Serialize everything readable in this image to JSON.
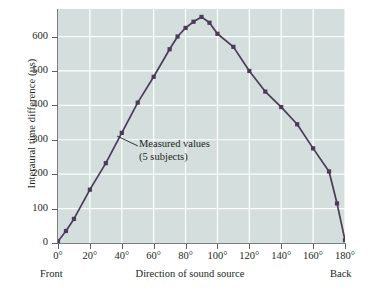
{
  "chart_data": {
    "type": "line",
    "title": "",
    "xlabel": "Direction of sound source",
    "ylabel": "Interaural time difference (µs)",
    "xlim": [
      0,
      180
    ],
    "ylim": [
      0,
      680
    ],
    "grid": true,
    "legend_position": "none",
    "xticks": [
      "0°",
      "20°",
      "40°",
      "60°",
      "80°",
      "100°",
      "120°",
      "140°",
      "160°",
      "180°"
    ],
    "xtick_values": [
      0,
      20,
      40,
      60,
      80,
      100,
      120,
      140,
      160,
      180
    ],
    "yticks": [
      "0",
      "100",
      "200",
      "300",
      "400",
      "500",
      "600"
    ],
    "ytick_values": [
      0,
      100,
      200,
      300,
      400,
      500,
      600
    ],
    "x_end_labels": {
      "left": "Front",
      "right": "Back"
    },
    "series": [
      {
        "name": "Measured values (5 subjects)",
        "color": "#4b3a5a",
        "marker": "square",
        "x": [
          0,
          5,
          10,
          20,
          30,
          40,
          50,
          60,
          70,
          75,
          80,
          85,
          90,
          95,
          100,
          110,
          120,
          130,
          140,
          150,
          160,
          170,
          175,
          180
        ],
        "y": [
          5,
          35,
          70,
          155,
          232,
          320,
          408,
          483,
          563,
          600,
          625,
          643,
          657,
          640,
          608,
          570,
          500,
          440,
          395,
          345,
          275,
          208,
          115,
          8
        ]
      }
    ],
    "annotations": [
      {
        "text_lines": [
          "Measured values",
          "(5 subjects)"
        ],
        "leader_from": [
          138,
          146
        ],
        "leader_to": [
          117,
          136
        ]
      }
    ]
  },
  "axis": {
    "y_title": "Interaural time difference (µs)",
    "x_title": "Direction of sound source",
    "front": "Front",
    "back": "Back"
  },
  "annotation": {
    "line1": "Measured values",
    "line2": "(5 subjects)"
  },
  "colors": {
    "plot_background": "#d3dedd",
    "gridline": "#ffffff",
    "series": "#4b3a5a",
    "axis": "#7c7f80",
    "text": "#231f20",
    "page_background": "#ffffff"
  }
}
